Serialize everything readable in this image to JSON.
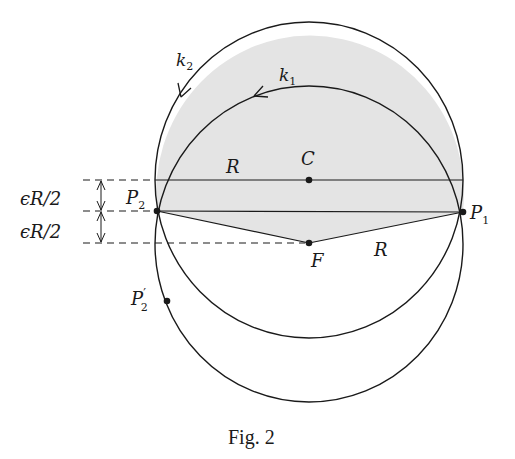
{
  "figure": {
    "caption": "Fig. 2",
    "colors": {
      "stroke": "#1a1a1a",
      "shading": "#e4e4e4",
      "background": "#ffffff"
    },
    "labels": {
      "k2": {
        "base": "k",
        "sub": "2"
      },
      "k1": {
        "base": "k",
        "sub": "1"
      },
      "C": "C",
      "F": "F",
      "R_top": "R",
      "R_bottom": "R",
      "P1": {
        "base": "P",
        "sub": "1"
      },
      "P2": {
        "base": "P",
        "sub": "2"
      },
      "P2prime": {
        "base": "P",
        "sup": "′",
        "sub": "2"
      },
      "eps_upper": "ϵR/2",
      "eps_lower": "ϵR/2"
    },
    "points": {
      "C": [
        309,
        180
      ],
      "F": [
        309,
        243
      ],
      "P1": [
        463,
        212
      ],
      "P2": [
        157,
        211
      ],
      "P2prime": [
        167,
        301
      ]
    },
    "circles": [
      {
        "name": "circle-centered-C",
        "center": [
          309,
          180
        ],
        "rx": 154,
        "ry": 158
      },
      {
        "name": "circle-centered-F",
        "center": [
          309,
          243
        ],
        "rx": 154,
        "ry": 158
      }
    ]
  }
}
